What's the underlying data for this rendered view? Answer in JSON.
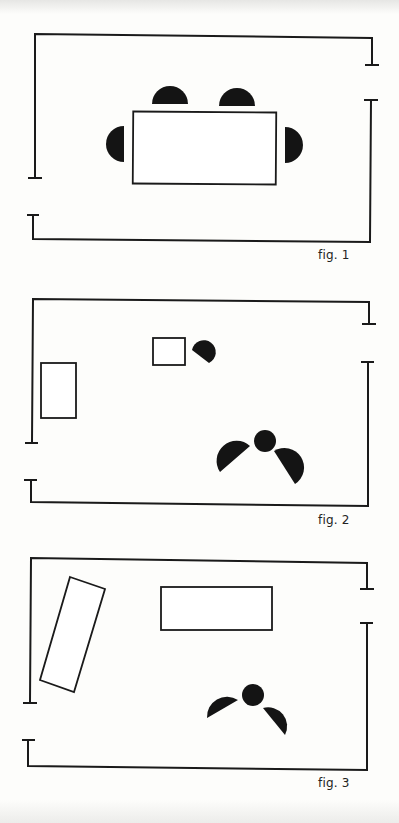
{
  "figures": [
    {
      "id": "fig1",
      "caption": "fig. 1",
      "description": "Room with a rectangular table and four chairs arranged around it",
      "furniture": [
        "table",
        "chair",
        "chair",
        "chair",
        "chair"
      ]
    },
    {
      "id": "fig2",
      "caption": "fig. 2",
      "description": "Room with two small rectangles, one chair by the small table, and a round table with two chairs",
      "furniture": [
        "rectangle",
        "small-table",
        "chair",
        "round-table",
        "chair",
        "chair"
      ]
    },
    {
      "id": "fig3",
      "caption": "fig. 3",
      "description": "Room with an angled rectangle, a rectangular table, and a round table with two chairs",
      "furniture": [
        "angled-rectangle",
        "table",
        "round-table",
        "chair",
        "chair"
      ]
    }
  ],
  "colors": {
    "ink": "#1a1a1a",
    "paper": "#fdfdfb"
  }
}
